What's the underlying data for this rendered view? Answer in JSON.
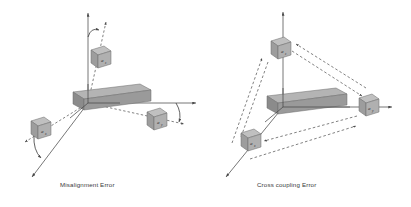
{
  "figure": {
    "background": "#ffffff",
    "stroke_color": "#4a4a4a",
    "slab_top_color": "#b3b3b3",
    "slab_front_color": "#8d8d8d",
    "slab_side_color": "#6f6f6f",
    "cube_top_color": "#bdbdbd",
    "cube_front_color": "#9c9c9c",
    "cube_side_color": "#7e7e7e"
  },
  "panels": [
    {
      "id": "misalignment",
      "caption": "Misalignment Error",
      "origin": {
        "x": 88,
        "y": 103
      },
      "axes": [
        {
          "name": "z-axis-true",
          "style": "solid",
          "label": "",
          "direction": "up"
        },
        {
          "name": "z-axis-misaligned",
          "style": "dashed",
          "label": "",
          "direction": "up-right"
        },
        {
          "name": "y-axis-true",
          "style": "solid",
          "label": "",
          "direction": "right"
        },
        {
          "name": "y-axis-misaligned",
          "style": "dashed",
          "label": "",
          "direction": "right-down"
        },
        {
          "name": "x-axis-true",
          "style": "solid",
          "label": "",
          "direction": "down-left"
        },
        {
          "name": "x-axis-misaligned",
          "style": "dashed",
          "label": "",
          "direction": "down-left-shallow"
        }
      ],
      "angle_arcs": [
        {
          "name": "theta-z",
          "between": [
            "z-axis-true",
            "z-axis-misaligned"
          ]
        },
        {
          "name": "theta-y",
          "between": [
            "y-axis-true",
            "y-axis-misaligned"
          ]
        },
        {
          "name": "theta-x",
          "between": [
            "x-axis-true",
            "x-axis-misaligned"
          ]
        }
      ],
      "sensors": [
        {
          "name": "sensor-az",
          "label": "a",
          "sub": "z",
          "x": 99,
          "y": 57
        },
        {
          "name": "sensor-ay",
          "label": "a",
          "sub": "y",
          "x": 156,
          "y": 120
        },
        {
          "name": "sensor-ax",
          "label": "a",
          "sub": "x",
          "x": 40,
          "y": 129
        }
      ]
    },
    {
      "id": "crosscoupling",
      "caption": "Cross coupling Error",
      "origin": {
        "x": 283,
        "y": 107
      },
      "axes": [
        {
          "name": "z-axis",
          "style": "solid",
          "label": "",
          "direction": "up"
        },
        {
          "name": "y-axis",
          "style": "solid",
          "label": "",
          "direction": "right"
        },
        {
          "name": "x-axis",
          "style": "solid",
          "label": "",
          "direction": "down-left"
        }
      ],
      "coupling_arrows": [
        {
          "name": "coupling-az-to-ay",
          "from": "sensor-az",
          "to": "sensor-ay"
        },
        {
          "name": "coupling-ay-to-az",
          "from": "sensor-ay",
          "to": "sensor-az"
        },
        {
          "name": "coupling-az-to-ax",
          "from": "sensor-az",
          "to": "sensor-ax"
        },
        {
          "name": "coupling-ax-to-az",
          "from": "sensor-ax",
          "to": "sensor-az"
        },
        {
          "name": "coupling-ax-to-ay",
          "from": "sensor-ax",
          "to": "sensor-ay"
        },
        {
          "name": "coupling-ay-to-ax",
          "from": "sensor-ay",
          "to": "sensor-ax"
        }
      ],
      "sensors": [
        {
          "name": "sensor-az",
          "label": "a",
          "sub": "z",
          "x": 278,
          "y": 49
        },
        {
          "name": "sensor-ay",
          "label": "a",
          "sub": "y",
          "x": 366,
          "y": 106
        },
        {
          "name": "sensor-ax",
          "label": "a",
          "sub": "x",
          "x": 250,
          "y": 141
        }
      ]
    }
  ]
}
